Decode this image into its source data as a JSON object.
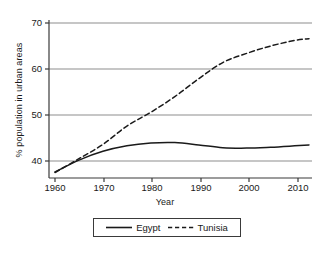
{
  "chart_data": {
    "type": "line",
    "title": "",
    "xlabel": "Year",
    "ylabel": "% population in urban areas",
    "xlim": [
      1960,
      2013
    ],
    "ylim": [
      36.5,
      70
    ],
    "grid": true,
    "legend_position": "bottom",
    "xticks": [
      1960,
      1970,
      1980,
      1990,
      2000,
      2010
    ],
    "yticks": [
      40,
      50,
      60,
      70
    ],
    "x": [
      1960,
      1965,
      1970,
      1975,
      1980,
      1985,
      1990,
      1995,
      2000,
      2005,
      2010,
      2013
    ],
    "series": [
      {
        "name": "Egypt",
        "style": "solid",
        "color": "#1a1a1a",
        "values": [
          37.6,
          40.2,
          42.1,
          43.3,
          43.9,
          44.0,
          43.5,
          42.9,
          42.8,
          43.0,
          43.3,
          43.5
        ]
      },
      {
        "name": "Tunisia",
        "style": "dashed",
        "color": "#1a1a1a",
        "values": [
          37.5,
          40.5,
          43.6,
          47.6,
          50.6,
          54.0,
          57.9,
          61.4,
          63.4,
          65.0,
          66.2,
          66.6
        ]
      }
    ]
  },
  "axes": {
    "ytick_labels": [
      "40",
      "50",
      "60",
      "70"
    ],
    "xtick_labels": [
      "1960",
      "1970",
      "1980",
      "1990",
      "2000",
      "2010"
    ],
    "y_axis_title": "% population in urban areas",
    "x_axis_title": "Year"
  },
  "legend": {
    "entries": [
      {
        "label": "Egypt",
        "style": "solid"
      },
      {
        "label": "Tunisia",
        "style": "dashed"
      }
    ]
  },
  "colors": {
    "line": "#1a1a1a",
    "grid": "#8d8d8d",
    "axis": "#3a3a3a",
    "background": "#ffffff"
  }
}
